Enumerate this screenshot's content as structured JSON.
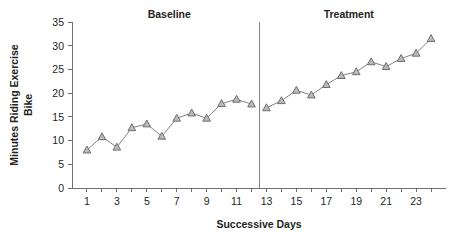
{
  "chart_data": {
    "type": "line",
    "title": "",
    "xlabel": "Successive Days",
    "ylabel": "Minutes Riding Exercise Bike",
    "ylabel_lines": [
      "Minutes Riding Exercise",
      "Bike"
    ],
    "xlim": [
      0,
      25
    ],
    "ylim": [
      0,
      35
    ],
    "ytick_step": 5,
    "yticks": [
      0,
      5,
      10,
      15,
      20,
      25,
      30,
      35
    ],
    "ytick_labels": [
      "0",
      "5",
      "10",
      "15",
      "20",
      "25",
      "30",
      "35"
    ],
    "xticks": [
      1,
      2,
      3,
      4,
      5,
      6,
      7,
      8,
      9,
      10,
      11,
      12,
      13,
      14,
      15,
      16,
      17,
      18,
      19,
      20,
      21,
      22,
      23,
      24
    ],
    "xtick_labels_shown": [
      "1",
      "3",
      "5",
      "7",
      "9",
      "11",
      "13",
      "15",
      "17",
      "19",
      "21",
      "23"
    ],
    "xtick_label_values": [
      1,
      3,
      5,
      7,
      9,
      11,
      13,
      15,
      17,
      19,
      21,
      23
    ],
    "grid": false,
    "legend": false,
    "marker": "triangle-up",
    "marker_fill": "#b9babc",
    "marker_edge": "#6d6e71",
    "line_color": "#808285",
    "x": [
      1,
      2,
      3,
      4,
      5,
      6,
      7,
      8,
      9,
      10,
      11,
      12,
      13,
      14,
      15,
      16,
      17,
      18,
      19,
      20,
      21,
      22,
      23,
      24
    ],
    "values": [
      8.0,
      10.8,
      8.6,
      12.7,
      13.5,
      10.9,
      14.7,
      15.8,
      14.7,
      17.8,
      18.7,
      17.7,
      16.9,
      18.4,
      20.6,
      19.6,
      21.8,
      23.7,
      24.5,
      26.6,
      25.6,
      27.3,
      28.4,
      31.5
    ],
    "series": [
      {
        "name": "Baseline",
        "x": [
          1,
          2,
          3,
          4,
          5,
          6,
          7,
          8,
          9,
          10,
          11,
          12
        ],
        "values": [
          8.0,
          10.8,
          8.6,
          12.7,
          13.5,
          10.9,
          14.7,
          15.8,
          14.7,
          17.8,
          18.7,
          17.7
        ]
      },
      {
        "name": "Treatment",
        "x": [
          13,
          14,
          15,
          16,
          17,
          18,
          19,
          20,
          21,
          22,
          23,
          24
        ],
        "values": [
          16.9,
          18.4,
          20.6,
          19.6,
          21.8,
          23.7,
          24.5,
          26.6,
          25.6,
          27.3,
          28.4,
          31.5
        ]
      }
    ],
    "phase_labels": [
      {
        "text": "Baseline",
        "center_day": 6.5
      },
      {
        "text": "Treatment",
        "center_day": 18.5
      }
    ],
    "phase_line": {
      "at_day": 12.5,
      "color": "#808285"
    }
  }
}
